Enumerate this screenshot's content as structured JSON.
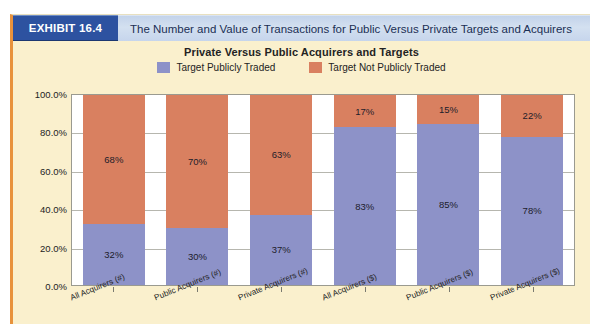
{
  "exhibit": {
    "badge": "EXHIBIT 16.4",
    "title": "The Number and Value of Transactions for Public Versus Private Targets and Acquirers"
  },
  "colors": {
    "series_publicly_traded": "#8d92c8",
    "series_not_publicly_traded": "#d98060",
    "badge_bg": "#2d52a0",
    "header_bg": "#c9d7ec",
    "page_bg": "#faf0cd",
    "plot_bg": "#ffffff",
    "gridline": "#b6b6ae",
    "frame_accent": "#e8923c"
  },
  "chart_data": {
    "type": "bar",
    "stacked": true,
    "title": "Private Versus Public Acquirers and Targets",
    "xlabel": "",
    "ylabel": "",
    "ylim": [
      0,
      100
    ],
    "ytick_labels": [
      "0.0%",
      "20.0%",
      "40.0%",
      "60.0%",
      "80.0%",
      "100.0%"
    ],
    "ytick_values": [
      0,
      20,
      40,
      60,
      80,
      100
    ],
    "grid": true,
    "legend_position": "top",
    "categories": [
      "All Acquirers (#)",
      "Public Acquirers (#)",
      "Private Acquirers (#)",
      "All Acquirers ($)",
      "Public Acquirers ($)",
      "Private Acquirers ($)"
    ],
    "series": [
      {
        "name": "Target Publicly Traded",
        "color": "#8d92c8",
        "values": [
          32,
          30,
          37,
          83,
          85,
          78
        ],
        "labels": [
          "32%",
          "30%",
          "37%",
          "83%",
          "85%",
          "78%"
        ]
      },
      {
        "name": "Target Not Publicly Traded",
        "color": "#d98060",
        "values": [
          68,
          70,
          63,
          17,
          15,
          22
        ],
        "labels": [
          "68%",
          "70%",
          "63%",
          "17%",
          "15%",
          "22%"
        ]
      }
    ]
  }
}
